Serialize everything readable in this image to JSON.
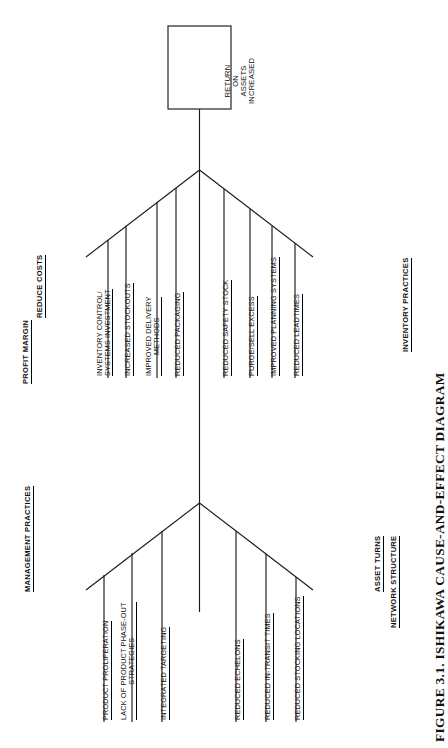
{
  "figure": {
    "caption": "FIGURE 3.1.   ISHIKAWA CAUSE-AND-EFFECT DIAGRAM",
    "orientation": "rotated-90-ccw",
    "type": "ishikawa-fishbone",
    "line_color": "#1a1a1a",
    "background": "#ffffff"
  },
  "effect_box": {
    "name": "return-on-assets-box",
    "lines": [
      "RETURN",
      "ON",
      "ASSETS",
      "INCREASED"
    ]
  },
  "spine_labels": [
    {
      "id": "profit-margin",
      "text": "PROFIT MARGIN"
    },
    {
      "id": "asset-turns",
      "text": "ASSET TURNS"
    }
  ],
  "categories": [
    {
      "id": "reduce-costs",
      "title": "REDUCE COSTS",
      "causes": [
        {
          "id": "inventory-control-systems-investment",
          "line1": "INVENTORY CONTROL/",
          "line2": "SYSTEMS INVESTMENT"
        },
        {
          "id": "increased-stockouts",
          "line1": "INCREASED STOCKOUTS",
          "line2": ""
        },
        {
          "id": "improved-delivery-methods",
          "line1": "IMPROVED DELIVERY",
          "line2": "METHODS"
        },
        {
          "id": "reduced-packaging",
          "line1": "REDUCED PACKAGING",
          "line2": ""
        }
      ]
    },
    {
      "id": "inventory-practices",
      "title": "INVENTORY PRACTICES",
      "causes": [
        {
          "id": "reduced-safety-stock",
          "line1": "REDUCED SAFETY STOCK",
          "line2": ""
        },
        {
          "id": "purge-sell-excess",
          "line1": "PURGE/SELL EXCESS",
          "line2": ""
        },
        {
          "id": "improved-planning-systems",
          "line1": "IMPROVED PLANNING SYSTEMS",
          "line2": ""
        },
        {
          "id": "reduced-leadtimes",
          "line1": "REDUCED LEADTIMES",
          "line2": ""
        }
      ]
    },
    {
      "id": "management-practices",
      "title": "MANAGEMENT PRACTICES",
      "causes": [
        {
          "id": "product-proliferation",
          "line1": "PRODUCT PROLIFERATION",
          "line2": ""
        },
        {
          "id": "lack-of-product-phase-out-strategies",
          "line1": "LACK OF PRODUCT PHASE-OUT",
          "line2": "STRATEGIES"
        },
        {
          "id": "integrated-targeting",
          "line1": "INTEGRATED TARGETING",
          "line2": ""
        }
      ]
    },
    {
      "id": "network-structure",
      "title": "NETWORK STRUCTURE",
      "causes": [
        {
          "id": "reduced-echelons",
          "line1": "REDUCED ECHELONS",
          "line2": ""
        },
        {
          "id": "reduced-in-transit-times",
          "line1": "REDUCED IN-TRANSIT TIMES",
          "line2": ""
        },
        {
          "id": "reduced-stocking-locations",
          "line1": "REDUCED STOCKING LOCATIONS",
          "line2": ""
        }
      ]
    }
  ]
}
